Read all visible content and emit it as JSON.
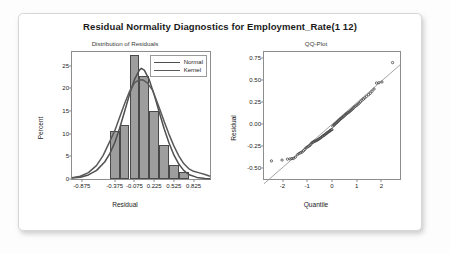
{
  "figure": {
    "title": "Residual Normality Diagnostics for Employment_Rate(1 12)"
  },
  "left_panel": {
    "subtitle": "Distribution of Residuals",
    "xlabel": "Residual",
    "ylabel": "Percent",
    "legend": [
      {
        "label": "Normal",
        "color": "#4f4f4f"
      },
      {
        "label": "Kernel",
        "color": "#5a5a5a"
      }
    ],
    "yticks": [
      "0",
      "5",
      "10",
      "15",
      "20",
      "25"
    ],
    "xticks": [
      "-0.875",
      "-0.375",
      "-0.075",
      "0.225",
      "0.525",
      "0.825"
    ]
  },
  "right_panel": {
    "subtitle": "QQ-Plot",
    "xlabel": "Quantile",
    "ylabel": "Residual",
    "yticks": [
      "-0.50",
      "-0.25",
      "0.00",
      "0.25",
      "0.50",
      "0.75"
    ],
    "xticks": [
      "-2",
      "-1",
      "0",
      "1",
      "2"
    ]
  },
  "chart_data": [
    {
      "type": "bar",
      "title": "Distribution of Residuals",
      "xlabel": "Residual",
      "ylabel": "Percent",
      "xlim": [
        -1.025,
        1.075
      ],
      "ylim": [
        0,
        28
      ],
      "xtick_values": [
        -0.875,
        -0.375,
        -0.075,
        0.225,
        0.525,
        0.825
      ],
      "ytick_values": [
        0,
        5,
        10,
        15,
        20,
        25
      ],
      "bin_width": 0.15,
      "bin_centers": [
        -0.375,
        -0.225,
        -0.075,
        0.075,
        0.225,
        0.375,
        0.525,
        0.675
      ],
      "categories": [
        "-0.45..-0.30",
        "-0.30..-0.15",
        "-0.15..0.00",
        "0.00..0.15",
        "0.15..0.30",
        "0.30..0.45",
        "0.45..0.60",
        "0.60..0.75"
      ],
      "values": [
        10.5,
        12.0,
        27.3,
        22.7,
        15.0,
        7.5,
        3.0,
        1.5
      ],
      "grid": false,
      "legend_position": "top-right",
      "series": [
        {
          "name": "Normal",
          "type": "line",
          "x": [
            -1.025,
            -0.9,
            -0.775,
            -0.65,
            -0.525,
            -0.45,
            -0.375,
            -0.3,
            -0.225,
            -0.15,
            -0.075,
            0.0,
            0.03,
            0.075,
            0.15,
            0.225,
            0.3,
            0.375,
            0.45,
            0.525,
            0.6,
            0.675,
            0.75,
            0.875,
            1.0,
            1.075
          ],
          "values": [
            0.2,
            0.4,
            0.9,
            1.9,
            3.8,
            5.6,
            8.0,
            11.2,
            14.9,
            18.6,
            21.9,
            24.0,
            24.4,
            24.0,
            21.9,
            18.6,
            14.9,
            11.2,
            8.0,
            5.3,
            3.3,
            1.9,
            1.0,
            0.35,
            0.12,
            0.06
          ]
        },
        {
          "name": "Kernel",
          "type": "line",
          "x": [
            -1.025,
            -0.9,
            -0.775,
            -0.65,
            -0.55,
            -0.45,
            -0.375,
            -0.3,
            -0.225,
            -0.15,
            -0.075,
            0.0,
            0.06,
            0.12,
            0.2,
            0.3,
            0.375,
            0.45,
            0.525,
            0.6,
            0.675,
            0.75,
            0.825,
            0.9,
            1.0,
            1.075
          ],
          "values": [
            0.3,
            0.6,
            1.4,
            3.0,
            5.2,
            8.3,
            10.6,
            13.6,
            16.6,
            19.3,
            21.2,
            21.9,
            21.8,
            21.2,
            19.6,
            15.8,
            12.8,
            9.9,
            7.3,
            5.1,
            3.4,
            2.3,
            1.7,
            1.4,
            1.0,
            0.6
          ]
        }
      ]
    },
    {
      "type": "scatter",
      "title": "QQ-Plot",
      "xlabel": "Quantile",
      "ylabel": "Residual",
      "xlim": [
        -2.75,
        2.75
      ],
      "ylim": [
        -0.62,
        0.82
      ],
      "xtick_values": [
        -2,
        -1,
        0,
        1,
        2
      ],
      "ytick_values": [
        -0.5,
        -0.25,
        0,
        0.25,
        0.5,
        0.75
      ],
      "grid": false,
      "reference_line": {
        "intercept": 0.0,
        "slope": 0.245
      },
      "points": [
        [
          -2.45,
          -0.415
        ],
        [
          -2.02,
          -0.405
        ],
        [
          -1.8,
          -0.395
        ],
        [
          -1.7,
          -0.392
        ],
        [
          -1.62,
          -0.388
        ],
        [
          -1.55,
          -0.386
        ],
        [
          -1.48,
          -0.372
        ],
        [
          -1.4,
          -0.345
        ],
        [
          -1.33,
          -0.33
        ],
        [
          -1.27,
          -0.322
        ],
        [
          -1.21,
          -0.315
        ],
        [
          -1.15,
          -0.3
        ],
        [
          -1.1,
          -0.285
        ],
        [
          -1.05,
          -0.268
        ],
        [
          -1.0,
          -0.258
        ],
        [
          -0.95,
          -0.25
        ],
        [
          -0.9,
          -0.24
        ],
        [
          -0.86,
          -0.228
        ],
        [
          -0.82,
          -0.212
        ],
        [
          -0.78,
          -0.205
        ],
        [
          -0.74,
          -0.198
        ],
        [
          -0.7,
          -0.192
        ],
        [
          -0.66,
          -0.188
        ],
        [
          -0.62,
          -0.182
        ],
        [
          -0.58,
          -0.176
        ],
        [
          -0.55,
          -0.17
        ],
        [
          -0.51,
          -0.162
        ],
        [
          -0.47,
          -0.155
        ],
        [
          -0.44,
          -0.148
        ],
        [
          -0.4,
          -0.14
        ],
        [
          -0.37,
          -0.132
        ],
        [
          -0.33,
          -0.126
        ],
        [
          -0.3,
          -0.12
        ],
        [
          -0.27,
          -0.112
        ],
        [
          -0.23,
          -0.105
        ],
        [
          -0.2,
          -0.098
        ],
        [
          -0.17,
          -0.09
        ],
        [
          -0.13,
          -0.084
        ],
        [
          -0.1,
          -0.078
        ],
        [
          -0.07,
          -0.07
        ],
        [
          -0.03,
          -0.062
        ],
        [
          0.0,
          -0.06
        ],
        [
          0.03,
          -0.022
        ],
        [
          0.07,
          -0.012
        ],
        [
          0.1,
          -0.002
        ],
        [
          0.13,
          0.006
        ],
        [
          0.17,
          0.014
        ],
        [
          0.2,
          0.022
        ],
        [
          0.23,
          0.03
        ],
        [
          0.27,
          0.04
        ],
        [
          0.3,
          0.05
        ],
        [
          0.33,
          0.058
        ],
        [
          0.37,
          0.066
        ],
        [
          0.4,
          0.074
        ],
        [
          0.44,
          0.082
        ],
        [
          0.47,
          0.09
        ],
        [
          0.51,
          0.1
        ],
        [
          0.55,
          0.11
        ],
        [
          0.58,
          0.118
        ],
        [
          0.62,
          0.126
        ],
        [
          0.66,
          0.134
        ],
        [
          0.7,
          0.142
        ],
        [
          0.74,
          0.152
        ],
        [
          0.78,
          0.162
        ],
        [
          0.82,
          0.172
        ],
        [
          0.86,
          0.182
        ],
        [
          0.9,
          0.195
        ],
        [
          0.95,
          0.205
        ],
        [
          1.0,
          0.215
        ],
        [
          1.05,
          0.228
        ],
        [
          1.1,
          0.24
        ],
        [
          1.15,
          0.255
        ],
        [
          1.21,
          0.272
        ],
        [
          1.27,
          0.285
        ],
        [
          1.33,
          0.3
        ],
        [
          1.4,
          0.318
        ],
        [
          1.48,
          0.336
        ],
        [
          1.55,
          0.352
        ],
        [
          1.62,
          0.375
        ],
        [
          1.7,
          0.4
        ],
        [
          1.8,
          0.468
        ],
        [
          1.9,
          0.472
        ],
        [
          2.02,
          0.48
        ],
        [
          2.45,
          0.7
        ]
      ]
    }
  ]
}
